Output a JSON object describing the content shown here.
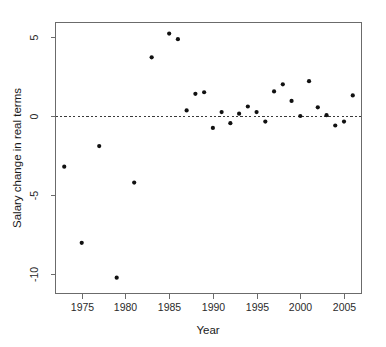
{
  "chart_data": {
    "type": "scatter",
    "title": "",
    "xlabel": "Year",
    "ylabel": "Salary change in real terms",
    "xlim": [
      1972,
      2007
    ],
    "ylim": [
      -11.2,
      5.9
    ],
    "xticks": [
      1975,
      1980,
      1985,
      1990,
      1995,
      2000,
      2005
    ],
    "xticklabels": [
      "1975",
      "1980",
      "1985",
      "1990",
      "1995",
      "2000",
      "2005"
    ],
    "yticks": [
      5,
      0,
      -5,
      -10
    ],
    "yticklabels": [
      "5",
      "0",
      "-5",
      "-10"
    ],
    "grid": false,
    "legend": null,
    "reference_lines": [
      {
        "orientation": "horizontal",
        "value": 0,
        "style": "dashed"
      }
    ],
    "marker": {
      "shape": "circle",
      "color": "#111111",
      "size": 2.1
    },
    "series": [
      {
        "name": "Salary change in real terms",
        "points": [
          {
            "x": 1973,
            "y": -3.2
          },
          {
            "x": 1975,
            "y": -8.0
          },
          {
            "x": 1977,
            "y": -1.9
          },
          {
            "x": 1979,
            "y": -10.2
          },
          {
            "x": 1981,
            "y": -4.2
          },
          {
            "x": 1983,
            "y": 3.7
          },
          {
            "x": 1985,
            "y": 5.2
          },
          {
            "x": 1986,
            "y": 4.85
          },
          {
            "x": 1987,
            "y": 0.35
          },
          {
            "x": 1988,
            "y": 1.4
          },
          {
            "x": 1989,
            "y": 1.5
          },
          {
            "x": 1990,
            "y": -0.75
          },
          {
            "x": 1991,
            "y": 0.25
          },
          {
            "x": 1992,
            "y": -0.45
          },
          {
            "x": 1993,
            "y": 0.15
          },
          {
            "x": 1994,
            "y": 0.6
          },
          {
            "x": 1995,
            "y": 0.25
          },
          {
            "x": 1996,
            "y": -0.35
          },
          {
            "x": 1997,
            "y": 1.55
          },
          {
            "x": 1998,
            "y": 2.0
          },
          {
            "x": 1999,
            "y": 0.95
          },
          {
            "x": 2000,
            "y": 0.0
          },
          {
            "x": 2001,
            "y": 2.2
          },
          {
            "x": 2002,
            "y": 0.55
          },
          {
            "x": 2003,
            "y": 0.05
          },
          {
            "x": 2004,
            "y": -0.6
          },
          {
            "x": 2005,
            "y": -0.35
          },
          {
            "x": 2006,
            "y": 1.3
          }
        ]
      }
    ]
  }
}
